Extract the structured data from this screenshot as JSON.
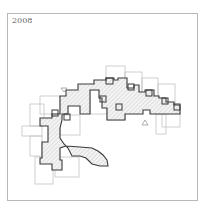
{
  "label": {
    "year": "2008"
  },
  "diagram": {
    "type": "architectural-plan",
    "colors": {
      "frame": "#b8b8b8",
      "outline": "#3a3a3a",
      "ghost": "#bdbdbd",
      "hatch": "#c4c4c4",
      "fill": "#f3f3f3",
      "marker": "#9a9a9a"
    },
    "markers": [
      {
        "name": "north-marker",
        "shape": "triangle-down",
        "x": 64,
        "y": 88
      },
      {
        "name": "south-marker",
        "shape": "triangle-up",
        "x": 145,
        "y": 123
      }
    ]
  }
}
